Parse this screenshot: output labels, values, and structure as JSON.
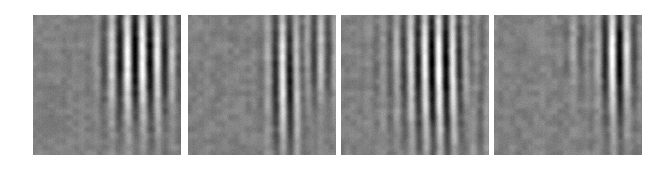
{
  "figure": {
    "name": "gabor-basis-function-panels",
    "background_color": "#ffffff",
    "width": 665,
    "height": 169,
    "panel_count": 4,
    "panel_width": 148,
    "panel_height": 140,
    "panel_top": 15,
    "panel_lefts": [
      33,
      188,
      341,
      494
    ],
    "caption": ""
  },
  "chart_data": {
    "type": "heatmap",
    "title": "",
    "subtitle": "",
    "xlabel": "",
    "ylabel": "",
    "grid": false,
    "legend": "none",
    "colormap": "gray",
    "value_range": [
      0,
      255
    ],
    "background_gray": 128,
    "noise_amplitude": 13,
    "panels": [
      {
        "index": 1,
        "label": "",
        "grid_size": [
          148,
          140
        ],
        "gabor": {
          "center_x_frac": 0.76,
          "center_y_frac": 0.28,
          "sigma_x_frac": 0.16,
          "sigma_y_frac": 0.3,
          "wavelength_px": 15,
          "orientation_deg": 0,
          "phase_deg": 90,
          "amplitude": 118
        },
        "secondary_gabor": {
          "center_x_frac": 0.56,
          "center_y_frac": 0.32,
          "sigma_x_frac": 0.1,
          "sigma_y_frac": 0.34,
          "wavelength_px": 17,
          "orientation_deg": 0,
          "phase_deg": 120,
          "amplitude": 46
        },
        "tail": {
          "center_x_frac": 0.78,
          "center_y_frac": 0.66,
          "sigma_x_frac": 0.09,
          "sigma_y_frac": 0.3,
          "wavelength_px": 15,
          "orientation_deg": 0,
          "phase_deg": 90,
          "amplitude": 26
        },
        "noise_seed": 101
      },
      {
        "index": 2,
        "label": "",
        "grid_size": [
          148,
          140
        ],
        "gabor": {
          "center_x_frac": 0.66,
          "center_y_frac": 0.34,
          "sigma_x_frac": 0.09,
          "sigma_y_frac": 0.34,
          "wavelength_px": 15,
          "orientation_deg": 0,
          "phase_deg": 90,
          "amplitude": 108
        },
        "secondary_gabor": {
          "center_x_frac": 0.87,
          "center_y_frac": 0.26,
          "sigma_x_frac": 0.11,
          "sigma_y_frac": 0.26,
          "wavelength_px": 15,
          "orientation_deg": 0,
          "phase_deg": 270,
          "amplitude": 72
        },
        "tail": {
          "center_x_frac": 0.67,
          "center_y_frac": 0.72,
          "sigma_x_frac": 0.07,
          "sigma_y_frac": 0.26,
          "wavelength_px": 15,
          "orientation_deg": 0,
          "phase_deg": 90,
          "amplitude": 36
        },
        "noise_seed": 202
      },
      {
        "index": 3,
        "label": "",
        "grid_size": [
          148,
          140
        ],
        "gabor": {
          "center_x_frac": 0.68,
          "center_y_frac": 0.32,
          "sigma_x_frac": 0.22,
          "sigma_y_frac": 0.34,
          "wavelength_px": 14,
          "orientation_deg": 0,
          "phase_deg": 90,
          "amplitude": 126
        },
        "secondary_gabor": {
          "center_x_frac": 0.92,
          "center_y_frac": 0.4,
          "sigma_x_frac": 0.09,
          "sigma_y_frac": 0.46,
          "wavelength_px": 14,
          "orientation_deg": 0,
          "phase_deg": 90,
          "amplitude": 84
        },
        "tail": {
          "center_x_frac": 0.7,
          "center_y_frac": 0.74,
          "sigma_x_frac": 0.16,
          "sigma_y_frac": 0.28,
          "wavelength_px": 14,
          "orientation_deg": 0,
          "phase_deg": 90,
          "amplitude": 48
        },
        "noise_seed": 303
      },
      {
        "index": 4,
        "label": "",
        "grid_size": [
          148,
          140
        ],
        "gabor": {
          "center_x_frac": 0.82,
          "center_y_frac": 0.26,
          "sigma_x_frac": 0.09,
          "sigma_y_frac": 0.26,
          "wavelength_px": 15,
          "orientation_deg": 0,
          "phase_deg": 90,
          "amplitude": 128
        },
        "secondary_gabor": {
          "center_x_frac": 0.56,
          "center_y_frac": 0.22,
          "sigma_x_frac": 0.07,
          "sigma_y_frac": 0.24,
          "wavelength_px": 16,
          "orientation_deg": 0,
          "phase_deg": 90,
          "amplitude": 40
        },
        "tail": {
          "center_x_frac": 0.83,
          "center_y_frac": 0.7,
          "sigma_x_frac": 0.07,
          "sigma_y_frac": 0.3,
          "wavelength_px": 15,
          "orientation_deg": 0,
          "phase_deg": 90,
          "amplitude": 34
        },
        "noise_seed": 404
      }
    ]
  }
}
